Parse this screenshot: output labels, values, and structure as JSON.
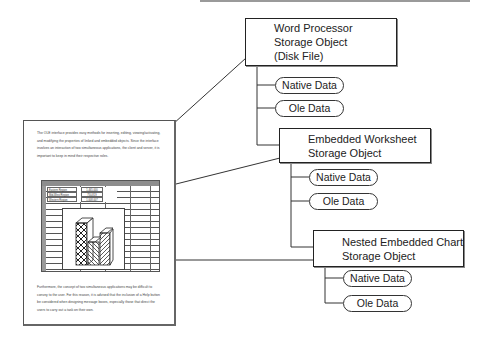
{
  "diagram": {
    "storage_objects": [
      {
        "id": "word",
        "title_lines": [
          "Word Processor",
          "Storage Object",
          "(Disk File)"
        ],
        "streams": [
          "Native Data",
          "Ole Data"
        ]
      },
      {
        "id": "worksheet",
        "title_lines": [
          "Embedded Worksheet",
          "Storage Object"
        ],
        "streams": [
          "Native Data",
          "Ole Data"
        ]
      },
      {
        "id": "chart",
        "title_lines": [
          "Nested Embedded Chart",
          "Storage Object"
        ],
        "streams": [
          "Native Data",
          "Ole Data"
        ]
      }
    ],
    "document": {
      "paragraph_top": "The OLE interface provides easy methods for inserting, editing, viewing/activating, and modifying the properties of linked and embedded objects. Since the interface involves an interaction of two simultaneous applications, the client and server, it is important to keep in mind their respective roles.",
      "paragraph_bottom": "Furthermore, the concept of two simultaneous applications may be difficult to convey to the user. For this reason, it is advised that the inclusion of a Help button be considered when designing message boxes, especially those that direct the users to carry out a task on their own.",
      "worksheet_rows": [
        {
          "label": "Eastern Region",
          "value": "1,465,000"
        },
        {
          "label": "Mid-West Region",
          "value": "750,819"
        },
        {
          "label": "Western Region",
          "value": "1,008,007"
        }
      ]
    }
  },
  "colors": {
    "line": "#222222",
    "sheet_header": "#8d8d8d",
    "top_bar": "#9a9a9a"
  }
}
